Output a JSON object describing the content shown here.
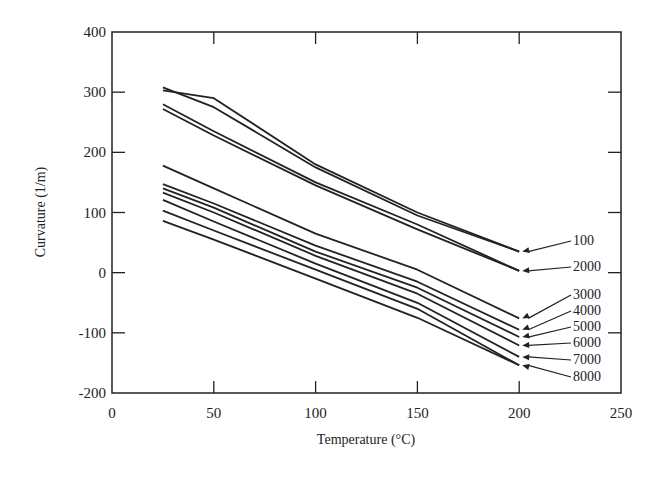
{
  "chart_data": {
    "type": "line",
    "title": "",
    "xlabel": "Temperature (°C)",
    "ylabel": "Curvature (1/m)",
    "xlim": [
      0,
      250
    ],
    "ylim": [
      -200,
      400
    ],
    "xticks": [
      0,
      50,
      100,
      150,
      200,
      250
    ],
    "yticks": [
      -200,
      -100,
      0,
      100,
      200,
      300,
      400
    ],
    "grid": false,
    "legend_position": "right, inline labels with arrows",
    "x": [
      25,
      50,
      100,
      150,
      200
    ],
    "series": [
      {
        "name": "100",
        "x": [
          25,
          50,
          100,
          150,
          200
        ],
        "values": [
          303,
          290,
          180,
          100,
          35
        ]
      },
      {
        "name": "100b",
        "x": [
          25,
          50,
          100,
          150,
          200
        ],
        "values": [
          308,
          275,
          175,
          95,
          35
        ]
      },
      {
        "name": "2000",
        "x": [
          25,
          50,
          100,
          150,
          200
        ],
        "values": [
          280,
          235,
          150,
          80,
          3
        ]
      },
      {
        "name": "2000b",
        "x": [
          25,
          50,
          100,
          150,
          200
        ],
        "values": [
          272,
          228,
          145,
          72,
          3
        ]
      },
      {
        "name": "3000",
        "x": [
          25,
          50,
          100,
          150,
          200
        ],
        "values": [
          178,
          140,
          65,
          5,
          -76
        ]
      },
      {
        "name": "4000",
        "x": [
          25,
          50,
          100,
          150,
          200
        ],
        "values": [
          147,
          115,
          45,
          -15,
          -95
        ]
      },
      {
        "name": "5000",
        "x": [
          25,
          50,
          100,
          150,
          200
        ],
        "values": [
          140,
          108,
          35,
          -25,
          -107
        ]
      },
      {
        "name": "6000",
        "x": [
          25,
          50,
          100,
          150,
          200
        ],
        "values": [
          133,
          100,
          28,
          -35,
          -121
        ]
      },
      {
        "name": "7000",
        "x": [
          25,
          50,
          100,
          150,
          200
        ],
        "values": [
          121,
          85,
          15,
          -50,
          -140
        ]
      },
      {
        "name": "8000",
        "x": [
          25,
          50,
          100,
          150,
          200
        ],
        "values": [
          103,
          70,
          5,
          -60,
          -154
        ]
      },
      {
        "name": "8000b",
        "x": [
          25,
          50,
          100,
          150,
          200
        ],
        "values": [
          86,
          55,
          -10,
          -75,
          -154
        ]
      }
    ],
    "annotations": [
      {
        "text": "100",
        "points_to": 35
      },
      {
        "text": "2000",
        "points_to": 3
      },
      {
        "text": "3000",
        "points_to": -76
      },
      {
        "text": "4000",
        "points_to": -95
      },
      {
        "text": "5000",
        "points_to": -107
      },
      {
        "text": "6000",
        "points_to": -121
      },
      {
        "text": "7000",
        "points_to": -140
      },
      {
        "text": "8000",
        "points_to": -154
      }
    ]
  },
  "labels": {
    "xlabel": "Temperature (°C)",
    "ylabel": "Curvature (1/m)"
  },
  "colors": {
    "line": "#222222",
    "background": "#ffffff"
  }
}
